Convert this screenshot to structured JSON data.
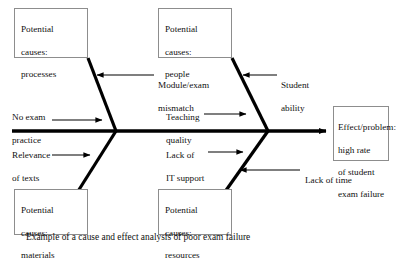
{
  "diagram": {
    "type": "fishbone-cause-and-effect",
    "title_caption": "Example of a cause and effect analysis of poor exam failure",
    "colors": {
      "background": "#ffffff",
      "spine": "#000000",
      "box_border": "#8d8d8d",
      "text": "#111111",
      "leader_line": "#000000"
    },
    "boxes": [
      {
        "id": "processes",
        "position": "top-left",
        "lines": [
          "Potential",
          "causes:",
          "processes"
        ]
      },
      {
        "id": "people",
        "position": "top-right",
        "lines": [
          "Potential",
          "causes:",
          "people"
        ]
      },
      {
        "id": "materials",
        "position": "bottom-left",
        "lines": [
          "Potential",
          "causes:",
          "materials"
        ]
      },
      {
        "id": "resources",
        "position": "bottom-right",
        "lines": [
          "Potential",
          "causes:",
          "resources"
        ]
      },
      {
        "id": "effect",
        "position": "right-head",
        "lines": [
          "Effect/problem:",
          "high rate",
          "of student",
          "exam failure"
        ]
      }
    ],
    "labels": [
      {
        "id": "module-exam-mismatch",
        "lines": [
          "Module/exam",
          "mismatch"
        ],
        "arrow": "left",
        "attaches_to": "processes"
      },
      {
        "id": "student-ability",
        "lines": [
          "Student",
          "ability"
        ],
        "arrow": "left",
        "attaches_to": "people"
      },
      {
        "id": "no-exam-practice",
        "lines": [
          "No exam",
          "practice"
        ],
        "arrow": "right",
        "attaches_to": "processes"
      },
      {
        "id": "teaching-quality",
        "lines": [
          "Teaching",
          "quality"
        ],
        "arrow": "right",
        "attaches_to": "people"
      },
      {
        "id": "relevance-of-texts",
        "lines": [
          "Relevance",
          "of texts"
        ],
        "arrow": "right",
        "attaches_to": "materials"
      },
      {
        "id": "lack-of-it-support",
        "lines": [
          "Lack of",
          "IT support"
        ],
        "arrow": "right",
        "attaches_to": "resources"
      },
      {
        "id": "lack-of-time",
        "lines": [
          "Lack of time"
        ],
        "arrow": "left",
        "attaches_to": "resources"
      }
    ]
  }
}
